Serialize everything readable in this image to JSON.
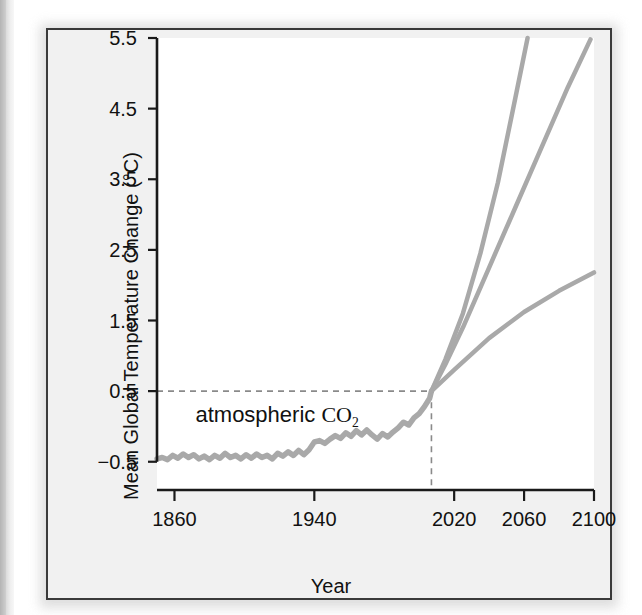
{
  "figure": {
    "background_outer": "#f1f1f1",
    "plot_background": "#ffffff",
    "frame_color": "#3a3a3a",
    "line_color": "#a9a9a9",
    "axis_color": "#1a1a1a",
    "dash_color": "#8a8a8a"
  },
  "chart_data": {
    "type": "line",
    "title": "",
    "xlabel": "Year",
    "ylabel": "Mean Global Temperature Change (°C)",
    "xlim": [
      1850,
      2100
    ],
    "ylim": [
      -0.9,
      5.5
    ],
    "grid": false,
    "legend_position": "none",
    "xticks": [
      1860,
      1940,
      2020,
      2060,
      2100
    ],
    "xtick_labels": [
      "1860",
      "1940",
      "2020",
      "2060",
      "2100"
    ],
    "yticks": [
      -0.5,
      0.5,
      1.5,
      2.5,
      3.5,
      4.5,
      5.5
    ],
    "ytick_labels": [
      "−0.5",
      "0.5",
      "1.5",
      "2.5",
      "3.5",
      "4.5",
      "5.5"
    ],
    "annotations": [
      {
        "name": "atmospheric-co2-label",
        "text_prefix": "atmospheric ",
        "text_formula": "CO",
        "text_subscript": "2",
        "x": 1872,
        "y": 0.12
      }
    ],
    "reference_lines": [
      {
        "name": "present-day-crosshair",
        "style": "dashed",
        "x": 2007,
        "y": 0.5,
        "description": "dashed horizontal at 0.5 C meeting dashed vertical at 2007"
      }
    ],
    "series": [
      {
        "name": "observed",
        "label": "atmospheric CO2 (observed record)",
        "style": "solid",
        "x": [
          1850,
          1853,
          1856,
          1859,
          1862,
          1865,
          1868,
          1871,
          1874,
          1877,
          1880,
          1883,
          1886,
          1889,
          1892,
          1895,
          1898,
          1901,
          1904,
          1907,
          1910,
          1913,
          1916,
          1919,
          1922,
          1925,
          1928,
          1931,
          1934,
          1937,
          1940,
          1943,
          1946,
          1949,
          1952,
          1955,
          1958,
          1961,
          1964,
          1967,
          1970,
          1973,
          1976,
          1979,
          1982,
          1985,
          1988,
          1991,
          1994,
          1997,
          2000,
          2003,
          2006,
          2007
        ],
        "y": [
          -0.46,
          -0.44,
          -0.47,
          -0.41,
          -0.45,
          -0.39,
          -0.44,
          -0.4,
          -0.46,
          -0.42,
          -0.47,
          -0.41,
          -0.45,
          -0.38,
          -0.44,
          -0.41,
          -0.46,
          -0.4,
          -0.45,
          -0.39,
          -0.44,
          -0.41,
          -0.46,
          -0.38,
          -0.42,
          -0.36,
          -0.41,
          -0.34,
          -0.4,
          -0.33,
          -0.22,
          -0.2,
          -0.24,
          -0.18,
          -0.13,
          -0.17,
          -0.09,
          -0.14,
          -0.06,
          -0.12,
          -0.05,
          -0.12,
          -0.18,
          -0.1,
          -0.15,
          -0.08,
          -0.02,
          0.06,
          0.02,
          0.12,
          0.18,
          0.28,
          0.4,
          0.5
        ]
      },
      {
        "name": "projection-high",
        "label": "high emissions projection",
        "style": "solid",
        "x": [
          2007,
          2015,
          2025,
          2035,
          2045,
          2055,
          2062
        ],
        "y": [
          0.5,
          0.95,
          1.6,
          2.45,
          3.45,
          4.65,
          5.5
        ]
      },
      {
        "name": "projection-mid",
        "label": "mid emissions projection",
        "style": "solid",
        "x": [
          2007,
          2015,
          2025,
          2040,
          2055,
          2070,
          2085,
          2098
        ],
        "y": [
          0.5,
          0.88,
          1.4,
          2.25,
          3.1,
          3.95,
          4.8,
          5.48
        ]
      },
      {
        "name": "projection-low",
        "label": "low emissions projection",
        "style": "solid",
        "x": [
          2007,
          2020,
          2040,
          2060,
          2080,
          2100
        ],
        "y": [
          0.5,
          0.8,
          1.25,
          1.62,
          1.92,
          2.18
        ]
      }
    ]
  }
}
